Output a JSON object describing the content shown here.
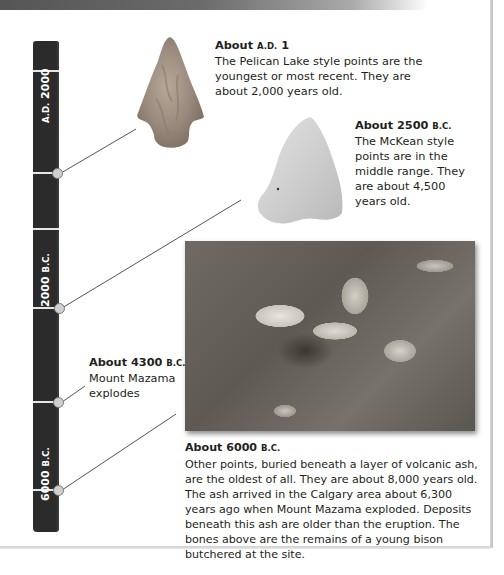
{
  "timeline": {
    "labels": [
      {
        "main": "A.D. 2000",
        "num": "2000",
        "era": "A.D."
      },
      {
        "main": "2000 B.C.",
        "num": "2000",
        "era": "B.C."
      },
      {
        "main": "6000 B.C.",
        "num": "6000",
        "era": "B.C."
      }
    ]
  },
  "entries": [
    {
      "id": "pelican-lake",
      "heading_prefix": "About ",
      "heading_era": "A.D.",
      "heading_year": " 1",
      "body": "The Pelican Lake style points are the youngest or most recent. They are about 2,000 years old."
    },
    {
      "id": "mckean",
      "heading_prefix": "About 2500 ",
      "heading_era": "B.C.",
      "body": "The McKean style points are in the middle range. They are about 4,500 years old."
    },
    {
      "id": "mazama",
      "heading_prefix": "About 4300 ",
      "heading_era": "B.C.",
      "body": "Mount Mazama explodes"
    },
    {
      "id": "ash-layer",
      "heading_prefix": "About 6000 ",
      "heading_era": "B.C.",
      "body": "Other points, buried beneath a layer of volcanic ash, are the oldest of all. They are about 8,000 years old. The ash arrived in the Calgary area about 6,300 years ago when Mount Mazama exploded. Deposits beneath this ash are older than the eruption. The bones above are the remains of a young bison butchered at the site."
    }
  ],
  "images": {
    "pelican_point": "Pelican Lake style projectile point",
    "mckean_point": "McKean style projectile point",
    "bison_bones": "Bison bones in excavation"
  },
  "colors": {
    "timeline_bar": "#2b2b2b",
    "tick": "#e6e6e6",
    "text": "#231f20",
    "connector": "#555555"
  }
}
